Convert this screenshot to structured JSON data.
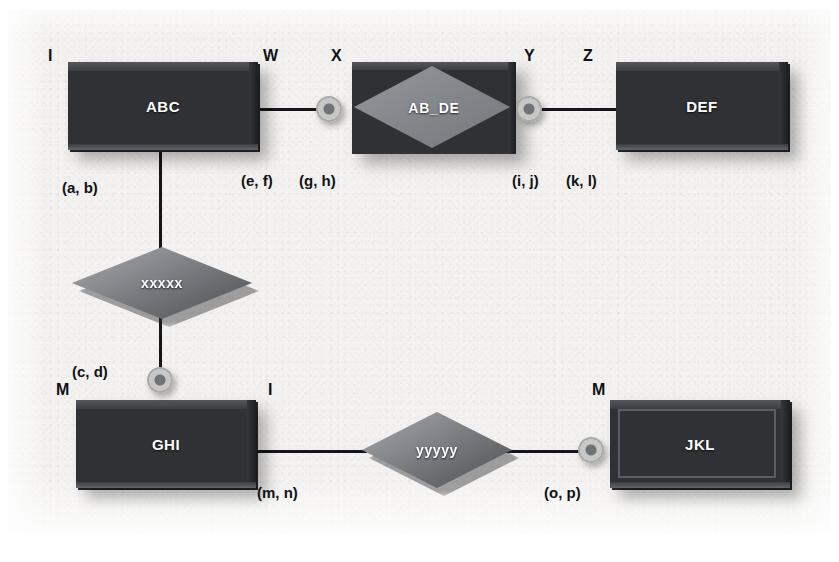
{
  "diagram": {
    "type": "er-diagram",
    "colors": {
      "page_background": "#f2f1ef",
      "entity_fill": "#2f3134",
      "relationship_fill": "#7d8084",
      "line": "#15161a",
      "entity_text": "#ffffff",
      "annotation_text": "#111216",
      "connector_ring": "#c7c8c6"
    }
  },
  "entities": [
    {
      "id": "abc",
      "label": "ABC",
      "kind": "strong-entity"
    },
    {
      "id": "def",
      "label": "DEF",
      "kind": "strong-entity"
    },
    {
      "id": "ghi",
      "label": "GHI",
      "kind": "strong-entity"
    },
    {
      "id": "jkl",
      "label": "JKL",
      "kind": "weak-entity"
    }
  ],
  "relationships": [
    {
      "id": "ab_de",
      "label": "AB_DE",
      "kind": "associative-entity"
    },
    {
      "id": "xxxxx",
      "label": "xxxxx",
      "kind": "relationship"
    },
    {
      "id": "yyyyy",
      "label": "yyyyy",
      "kind": "relationship"
    }
  ],
  "cardinality_labels": [
    {
      "id": "c_abc_left",
      "text": "I"
    },
    {
      "id": "c_abc_right",
      "text": "W"
    },
    {
      "id": "c_abde_left",
      "text": "X"
    },
    {
      "id": "c_abde_right",
      "text": "Y"
    },
    {
      "id": "c_def_left",
      "text": "Z"
    },
    {
      "id": "c_ghi_left",
      "text": "M"
    },
    {
      "id": "c_ghi_right",
      "text": "I"
    },
    {
      "id": "c_jkl_left",
      "text": "M"
    }
  ],
  "participation_labels": [
    {
      "id": "p_ab",
      "text": "(a, b)"
    },
    {
      "id": "p_cd",
      "text": "(c, d)"
    },
    {
      "id": "p_ef",
      "text": "(e, f)"
    },
    {
      "id": "p_gh",
      "text": "(g, h)"
    },
    {
      "id": "p_ij",
      "text": "(i, j)"
    },
    {
      "id": "p_kl",
      "text": "(k, l)"
    },
    {
      "id": "p_mn",
      "text": "(m, n)"
    },
    {
      "id": "p_op",
      "text": "(o, p)"
    }
  ]
}
